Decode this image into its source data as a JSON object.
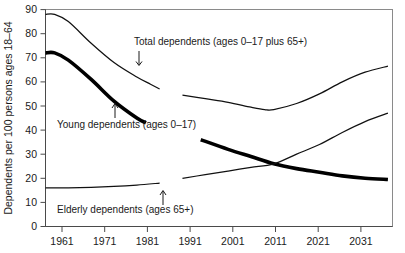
{
  "chart_data": {
    "type": "line",
    "title": "",
    "xlabel": "",
    "ylabel": "Dependents per 100 persons ages 18–64",
    "xlim": [
      1961,
      2037
    ],
    "ylim": [
      0,
      90
    ],
    "grid": false,
    "legend_position": "inline-annotations",
    "x_ticks": [
      "1961",
      "1971",
      "1981",
      "1991",
      "2001",
      "2011",
      "2021",
      "2031"
    ],
    "x_tick_values": [
      1961,
      1971,
      1981,
      1991,
      2001,
      2011,
      2021,
      2031
    ],
    "y_ticks": [
      "0",
      "10",
      "20",
      "30",
      "40",
      "50",
      "60",
      "70",
      "80",
      "90"
    ],
    "y_tick_values": [
      0,
      10,
      20,
      30,
      40,
      50,
      60,
      70,
      80,
      90
    ],
    "series": [
      {
        "name": "Total dependents (ages 0–17 plus 65+)",
        "style": "thin",
        "segments": [
          {
            "period": "historical",
            "x": [
              1961,
              1963,
              1966,
              1971,
              1976,
              1981,
              1984,
              1986
            ],
            "values": [
              88,
              88,
              85,
              76,
              68,
              62,
              59,
              57
            ]
          },
          {
            "period": "projected",
            "x": [
              1991,
              1996,
              2001,
              2006,
              2009,
              2011,
              2016,
              2021,
              2026,
              2031,
              2036
            ],
            "values": [
              54.5,
              53,
              51.5,
              49.5,
              48.5,
              48.5,
              51,
              55,
              60,
              64,
              66.5
            ]
          }
        ]
      },
      {
        "name": "Young dependents (ages 0–17)",
        "style": "thick",
        "segments": [
          {
            "period": "historical",
            "x": [
              1961,
              1963,
              1966,
              1971,
              1976,
              1981,
              1983
            ],
            "values": [
              72,
              72,
              69,
              61,
              52,
              45,
              43
            ]
          },
          {
            "period": "projected",
            "x": [
              1995,
              2001,
              2006,
              2011,
              2016,
              2021,
              2026,
              2031,
              2036
            ],
            "values": [
              36,
              32,
              29,
              26,
              24,
              22.5,
              21,
              20,
              19.5
            ]
          }
        ]
      },
      {
        "name": "Elderly dependents (ages 65+)",
        "style": "thin",
        "segments": [
          {
            "period": "historical",
            "x": [
              1961,
              1966,
              1971,
              1976,
              1981,
              1986
            ],
            "values": [
              16,
              16,
              16.2,
              16.6,
              17.2,
              18
            ]
          },
          {
            "period": "projected",
            "x": [
              1991,
              1996,
              2001,
              2006,
              2011,
              2016,
              2021,
              2026,
              2031,
              2036
            ],
            "values": [
              20,
              21.5,
              23,
              24.5,
              26,
              30,
              34,
              39,
              43.5,
              47
            ]
          }
        ]
      }
    ],
    "annotations": [
      {
        "id": "total",
        "text": "Total dependents (ages 0–17 plus 65+)",
        "arrow": "down"
      },
      {
        "id": "young",
        "text": "Young dependents (ages 0–17)",
        "arrow": "up"
      },
      {
        "id": "elderly",
        "text": "Elderly dependents (ages 65+)",
        "arrow": "up"
      }
    ]
  },
  "colors": {
    "line": "#111111",
    "frame": "#8a8a8a",
    "text": "#1a1a1a",
    "background": "#ffffff"
  }
}
